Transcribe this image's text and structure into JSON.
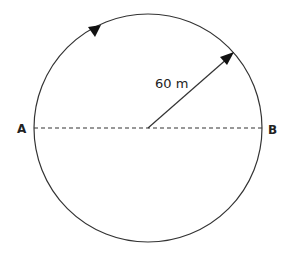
{
  "diagram": {
    "type": "circle-path",
    "radius_label": "60 m",
    "point_left": "A",
    "point_right": "B",
    "colors": {
      "stroke": "#333333",
      "background": "#ffffff"
    },
    "direction": "clockwise"
  }
}
